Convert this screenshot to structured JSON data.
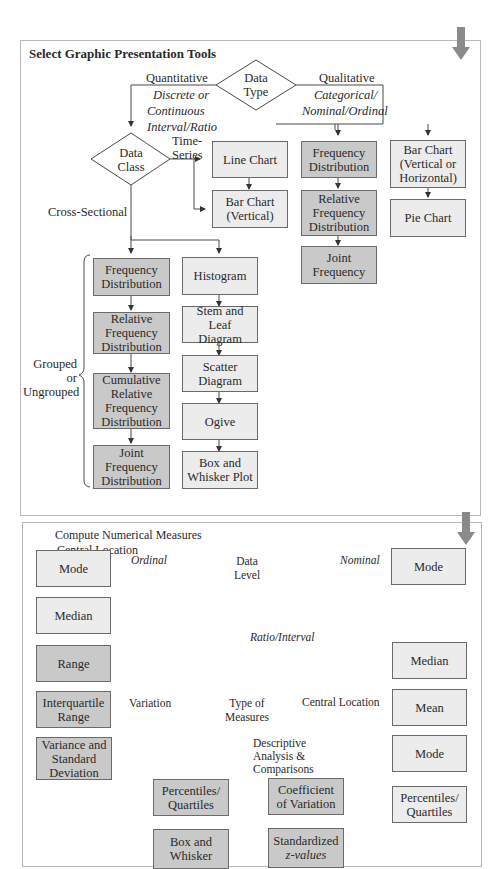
{
  "page_marker": "",
  "colors": {
    "dark_box": "#c9c9c9",
    "light_box": "#ececec",
    "line": "#4a4a4a",
    "arrow": "#8a8a8a"
  },
  "top_panel": {
    "title": "Select Graphic Presentation Tools",
    "data_type": {
      "line1": "Data",
      "line2": "Type"
    },
    "quantitative": {
      "label": "Quantitative",
      "sub1": "Discrete or",
      "sub2": "Continuous",
      "sub3": "Interval/Ratio"
    },
    "qualitative": {
      "label": "Qualitative",
      "sub1": "Categorical/",
      "sub2": "Nominal/Ordinal"
    },
    "data_class": {
      "line1": "Data",
      "line2": "Class"
    },
    "time_series": {
      "line1": "Time-",
      "line2": "Series"
    },
    "cross_sectional": "Cross-Sectional",
    "grouped": {
      "line1": "Grouped",
      "line2": "or",
      "line3": "Ungrouped"
    },
    "time_series_boxes": [
      {
        "line1": "Line Chart",
        "line2": ""
      },
      {
        "line1": "Bar Chart",
        "line2": "(Vertical)"
      }
    ],
    "grouped_boxes": [
      {
        "line1": "Frequency",
        "line2": "Distribution",
        "line3": "",
        "line4": ""
      },
      {
        "line1": "Relative",
        "line2": "Frequency",
        "line3": "Distribution",
        "line4": ""
      },
      {
        "line1": "Cumulative",
        "line2": "Relative",
        "line3": "Frequency",
        "line4": "Distribution"
      },
      {
        "line1": "Joint",
        "line2": "Frequency",
        "line3": "Distribution",
        "line4": ""
      }
    ],
    "chart_boxes": [
      {
        "line1": "Histogram",
        "line2": ""
      },
      {
        "line1": "Stem and Leaf",
        "line2": "Diagram"
      },
      {
        "line1": "Scatter",
        "line2": "Diagram"
      },
      {
        "line1": "Ogive",
        "line2": ""
      },
      {
        "line1": "Box and",
        "line2": "Whisker Plot"
      }
    ],
    "qualitative_freq_boxes": [
      {
        "line1": "Frequency",
        "line2": "Distribution",
        "line3": ""
      },
      {
        "line1": "Relative",
        "line2": "Frequency",
        "line3": "Distribution"
      },
      {
        "line1": "Joint",
        "line2": "Frequency",
        "line3": ""
      }
    ],
    "qualitative_chart_boxes": [
      {
        "line1": "Bar Chart",
        "line2": "(Vertical or",
        "line3": "Horizontal)"
      },
      {
        "line1": "Pie Chart",
        "line2": "",
        "line3": ""
      }
    ]
  },
  "bottom_panel": {
    "title1": "Compute Numerical Measures",
    "title2": "Central Location",
    "data_level": {
      "line1": "Data",
      "line2": "Level"
    },
    "ordinal": "Ordinal",
    "nominal": "Nominal",
    "ratio_interval": "Ratio/Interval",
    "ordinal_boxes": [
      "Mode",
      "Median"
    ],
    "nominal_box": "Mode",
    "type_of_measures": {
      "line1": "Type of",
      "line2": "Measures"
    },
    "variation": "Variation",
    "central_location": "Central Location",
    "descriptive": {
      "line1": "Descriptive",
      "line2": "Analysis &",
      "line3": "Comparisons"
    },
    "variation_boxes": [
      {
        "line1": "Range",
        "line2": "",
        "line3": ""
      },
      {
        "line1": "Interquartile",
        "line2": "Range",
        "line3": ""
      },
      {
        "line1": "Variance and",
        "line2": "Standard",
        "line3": "Deviation"
      }
    ],
    "central_boxes": [
      {
        "line1": "Median",
        "line2": ""
      },
      {
        "line1": "Mean",
        "line2": ""
      },
      {
        "line1": "Mode",
        "line2": ""
      },
      {
        "line1": "Percentiles/",
        "line2": "Quartiles"
      }
    ],
    "descriptive_boxes": [
      {
        "line1": "Percentiles/",
        "line2": "Quartiles"
      },
      {
        "line1": "Coefficient",
        "line2": "of Variation"
      },
      {
        "line1": "Box and",
        "line2": "Whisker"
      },
      {
        "line1": "Standardized",
        "line2": "z-values"
      }
    ]
  }
}
